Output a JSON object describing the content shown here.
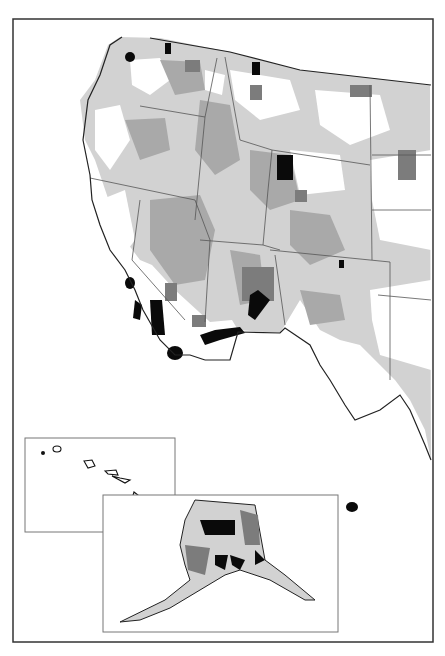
{
  "map": {
    "title": "",
    "frame": {
      "x": 13,
      "y": 19,
      "w": 420,
      "h": 623
    },
    "colors": {
      "background": "#ffffff",
      "outline": "#222222",
      "black": "#0a0a0a",
      "dark_gray": "#7c7c7c",
      "mid_gray": "#a9a9a9",
      "light_gray": "#d2d2d2",
      "state_border": "#555555",
      "inset_border": "#777777"
    },
    "insets": [
      {
        "name": "hawaii",
        "x": 25,
        "y": 438,
        "w": 150,
        "h": 94
      },
      {
        "name": "alaska",
        "x": 103,
        "y": 495,
        "w": 235,
        "h": 137
      }
    ],
    "legend": []
  }
}
